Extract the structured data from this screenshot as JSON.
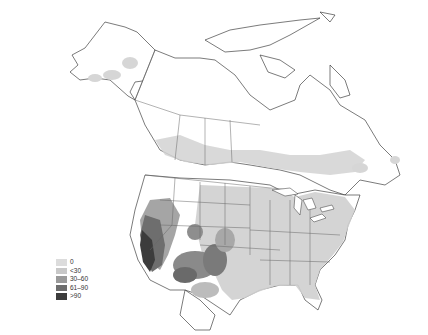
{
  "map": {
    "region": "North America",
    "style": "grayscale choropleth / density shading",
    "features": {
      "coastline_color": "#111111",
      "border_color": "#555555",
      "land_color": "#ffffff"
    }
  },
  "legend": {
    "title": "",
    "items": [
      {
        "label": "0",
        "color": "#dcdcdc"
      },
      {
        "label": "<30",
        "color": "#c8c8c8"
      },
      {
        "label": "30–60",
        "color": "#9a9a9a"
      },
      {
        "label": "61–90",
        "color": "#6e6e6e"
      },
      {
        "label": ">90",
        "color": "#3c3c3c"
      }
    ]
  }
}
